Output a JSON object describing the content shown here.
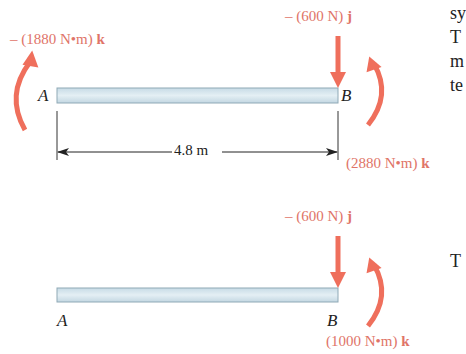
{
  "figure_top": {
    "moment_A_label": "– (1880 N•m) ",
    "moment_A_unit": "k",
    "force_B_label": "– (600 N) ",
    "force_B_unit": "j",
    "moment_B_label": "(2880 N•m) ",
    "moment_B_unit": "k",
    "point_A": "A",
    "point_B": "B",
    "dimension": "4.8 m"
  },
  "figure_bottom": {
    "force_B_label": "– (600 N) ",
    "force_B_unit": "j",
    "moment_B_label": "(1000 N•m) ",
    "moment_B_unit": "k",
    "point_A": "A",
    "point_B": "B"
  },
  "side_text": {
    "line1": "sy",
    "line2": "T",
    "line3": "m",
    "line4": "te",
    "line5": "T"
  },
  "colors": {
    "arrow": "#ef6f5c",
    "label": "#e07468",
    "beam_fill": "#d6e6ee",
    "beam_edge": "#8fa9b6"
  }
}
